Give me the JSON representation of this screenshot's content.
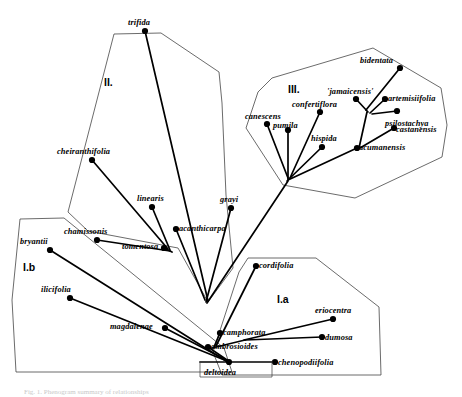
{
  "figure": {
    "type": "cladogram-with-hulls",
    "title_visible": false,
    "caption_partial": "Fig. 1.  Phenogram summary of relationships",
    "line_color": "#000000",
    "hull_color": "#3a3a3a",
    "background": "#ffffff"
  },
  "groups": [
    {
      "id": "II",
      "label": "II.",
      "x": 104,
      "y": 77
    },
    {
      "id": "III",
      "label": "III.",
      "x": 288,
      "y": 84
    },
    {
      "id": "Ib",
      "label": "I.b",
      "x": 23,
      "y": 262
    },
    {
      "id": "Ia",
      "label": "I.a",
      "x": 277,
      "y": 294
    }
  ],
  "taxa": [
    {
      "name": "trifida",
      "node_x": 145,
      "node_y": 31,
      "label_x": 128,
      "label_y": 19,
      "group": "II"
    },
    {
      "name": "cheiranthifolia",
      "node_x": 92,
      "node_y": 160,
      "label_x": 57,
      "label_y": 148,
      "group": "II"
    },
    {
      "name": "linearis",
      "node_x": 152,
      "node_y": 207,
      "label_x": 137,
      "label_y": 195,
      "group": "II"
    },
    {
      "name": "chamissonis",
      "node_x": 97,
      "node_y": 240,
      "label_x": 64,
      "label_y": 228,
      "group": "II"
    },
    {
      "name": "tomentosa",
      "node_x": 164,
      "node_y": 248,
      "label_x": 122,
      "label_y": 243,
      "group": "II"
    },
    {
      "name": "acanthicarpa",
      "node_x": 176,
      "node_y": 229,
      "label_x": 179,
      "label_y": 225,
      "group": "II"
    },
    {
      "name": "grayi",
      "node_x": 231,
      "node_y": 208,
      "label_x": 220,
      "label_y": 196,
      "group": "II"
    },
    {
      "name": "bidentata",
      "node_x": 400,
      "node_y": 68,
      "label_x": 360,
      "label_y": 57,
      "group": "III"
    },
    {
      "name": "'jamaicensis'",
      "node_x": 356,
      "node_y": 99,
      "label_x": 327,
      "label_y": 88,
      "group": "III"
    },
    {
      "name": "artemisiifolia",
      "node_x": 385,
      "node_y": 99,
      "label_x": 388,
      "label_y": 95,
      "group": "III"
    },
    {
      "name": "confertiflora",
      "node_x": 320,
      "node_y": 112,
      "label_x": 292,
      "label_y": 101,
      "group": "III"
    },
    {
      "name": "psilostachya",
      "node_x": 397,
      "node_y": 111,
      "label_x": 385,
      "label_y": 120,
      "group": "III"
    },
    {
      "name": "canescens",
      "node_x": 267,
      "node_y": 124,
      "label_x": 245,
      "label_y": 113,
      "group": "III"
    },
    {
      "name": "pumila",
      "node_x": 288,
      "node_y": 130,
      "label_x": 273,
      "label_y": 122,
      "group": "III"
    },
    {
      "name": "castanensis",
      "node_x": 394,
      "node_y": 128,
      "label_x": 396,
      "label_y": 126,
      "group": "III"
    },
    {
      "name": "hispida",
      "node_x": 322,
      "node_y": 147,
      "label_x": 311,
      "label_y": 135,
      "group": "III"
    },
    {
      "name": "acumanensis",
      "node_x": 357,
      "node_y": 148,
      "label_x": 359,
      "label_y": 144,
      "group": "III"
    },
    {
      "name": "bryantii",
      "node_x": 50,
      "node_y": 250,
      "label_x": 20,
      "label_y": 238,
      "group": "Ib"
    },
    {
      "name": "ilicifolia",
      "node_x": 70,
      "node_y": 298,
      "label_x": 41,
      "label_y": 286,
      "group": "Ib"
    },
    {
      "name": "magdalenae",
      "node_x": 165,
      "node_y": 328,
      "label_x": 110,
      "label_y": 323,
      "group": "Ib"
    },
    {
      "name": "cordifolia",
      "node_x": 256,
      "node_y": 266,
      "label_x": 259,
      "label_y": 262,
      "group": "Ia"
    },
    {
      "name": "eriocentra",
      "node_x": 333,
      "node_y": 319,
      "label_x": 315,
      "label_y": 307,
      "group": "Ia"
    },
    {
      "name": "camphorata",
      "node_x": 220,
      "node_y": 333,
      "label_x": 223,
      "label_y": 329,
      "group": "Ia"
    },
    {
      "name": "dumosa",
      "node_x": 322,
      "node_y": 337,
      "label_x": 325,
      "label_y": 334,
      "group": "Ia"
    },
    {
      "name": "ambrosioides",
      "node_x": 208,
      "node_y": 347,
      "label_x": 211,
      "label_y": 343,
      "group": "Ia"
    },
    {
      "name": "chenopodiifolia",
      "node_x": 275,
      "node_y": 362,
      "label_x": 278,
      "label_y": 359,
      "group": "Ia"
    },
    {
      "name": "deltoidea",
      "node_x": 229,
      "node_y": 362,
      "label_x": 204,
      "label_y": 369,
      "group": "Ia"
    }
  ],
  "root": {
    "x": 200,
    "y": 362
  },
  "branches": [
    {
      "from": [
        145,
        31
      ],
      "to": [
        208,
        301
      ]
    },
    {
      "from": [
        92,
        160
      ],
      "to": [
        168,
        249
      ]
    },
    {
      "from": [
        152,
        207
      ],
      "to": [
        170,
        250
      ]
    },
    {
      "from": [
        97,
        240
      ],
      "to": [
        170,
        251
      ]
    },
    {
      "from": [
        164,
        248
      ],
      "to": [
        172,
        252
      ]
    },
    {
      "from": [
        176,
        229
      ],
      "to": [
        205,
        300
      ]
    },
    {
      "from": [
        231,
        208
      ],
      "to": [
        206,
        302
      ]
    },
    {
      "from": [
        400,
        68
      ],
      "to": [
        366,
        110
      ]
    },
    {
      "from": [
        356,
        99
      ],
      "to": [
        368,
        112
      ]
    },
    {
      "from": [
        385,
        99
      ],
      "to": [
        370,
        113
      ]
    },
    {
      "from": [
        320,
        112
      ],
      "to": [
        290,
        178
      ]
    },
    {
      "from": [
        397,
        111
      ],
      "to": [
        372,
        114
      ]
    },
    {
      "from": [
        394,
        128
      ],
      "to": [
        360,
        148
      ]
    },
    {
      "from": [
        367,
        112
      ],
      "to": [
        359,
        148
      ]
    },
    {
      "from": [
        357,
        148
      ],
      "to": [
        288,
        180
      ]
    },
    {
      "from": [
        267,
        124
      ],
      "to": [
        288,
        178
      ]
    },
    {
      "from": [
        288,
        130
      ],
      "to": [
        288,
        179
      ]
    },
    {
      "from": [
        322,
        147
      ],
      "to": [
        287,
        181
      ]
    },
    {
      "from": [
        288,
        181
      ],
      "to": [
        207,
        303
      ]
    },
    {
      "from": [
        50,
        250
      ],
      "to": [
        226,
        361
      ]
    },
    {
      "from": [
        70,
        298
      ],
      "to": [
        227,
        361
      ]
    },
    {
      "from": [
        165,
        328
      ],
      "to": [
        228,
        361
      ]
    },
    {
      "from": [
        256,
        266
      ],
      "to": [
        216,
        346
      ]
    },
    {
      "from": [
        220,
        333
      ],
      "to": [
        214,
        347
      ]
    },
    {
      "from": [
        333,
        319
      ],
      "to": [
        244,
        340
      ]
    },
    {
      "from": [
        322,
        337
      ],
      "to": [
        245,
        340
      ]
    },
    {
      "from": [
        245,
        340
      ],
      "to": [
        212,
        348
      ]
    },
    {
      "from": [
        208,
        347
      ],
      "to": [
        230,
        362
      ]
    },
    {
      "from": [
        275,
        362
      ],
      "to": [
        229,
        362
      ]
    },
    {
      "from": [
        229,
        362
      ],
      "to": [
        200,
        362
      ]
    }
  ],
  "hulls": [
    {
      "id": "II",
      "points": "114,34 161,33 219,72 222,103 226,195 233,268 208,302 178,248 88,231 68,212"
    },
    {
      "id": "III",
      "points": "258,92 272,78 373,48 441,88 447,125 442,157 355,198 283,185 246,128"
    },
    {
      "id": "Ib",
      "points": "20,219 64,218 224,348 232,372 16,372 12,300"
    },
    {
      "id": "Ia",
      "points": "239,272 248,258 316,258 379,307 381,375 222,375 213,352"
    }
  ]
}
